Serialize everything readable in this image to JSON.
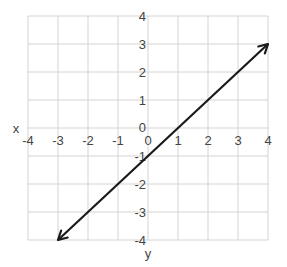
{
  "chart_data": {
    "type": "line",
    "title": "",
    "xlabel": "y",
    "ylabel": "x",
    "xlim": [
      -4,
      4
    ],
    "ylim": [
      -4,
      4
    ],
    "grid": true,
    "x_ticks": [
      "-4",
      "-3",
      "-2",
      "-1",
      "0",
      "1",
      "2",
      "3",
      "4"
    ],
    "y_ticks": [
      "4",
      "3",
      "2",
      "1",
      "0",
      "-1",
      "-2",
      "-3",
      "-4"
    ],
    "series": [
      {
        "name": "line",
        "equation": "y = x - 1",
        "x": [
          -3,
          4
        ],
        "y": [
          -4,
          3
        ],
        "arrows": "both",
        "color": "#1a1a1a"
      }
    ],
    "legend": null
  },
  "colors": {
    "grid": "#d4d4d4",
    "line": "#1a1a1a",
    "text": "#444444"
  },
  "labels": {
    "x_axis_name": "x",
    "y_axis_name": "y"
  }
}
